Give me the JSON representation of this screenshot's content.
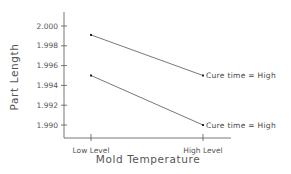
{
  "chart_data": {
    "type": "line",
    "title": "",
    "xlabel": "Mold Temperature",
    "ylabel": "Part Length",
    "categories": [
      "Low Level",
      "High Level"
    ],
    "ylim": [
      1.9885,
      2.0015
    ],
    "yticks": [
      "2.000",
      "1.998",
      "1.996",
      "1.994",
      "1.992",
      "1.990"
    ],
    "ytick_values": [
      2.0,
      1.998,
      1.996,
      1.994,
      1.992,
      1.99
    ],
    "grid": false,
    "legend": "inline labels at line ends",
    "series": [
      {
        "name": "Cure time = High",
        "values": [
          1.9991,
          1.995
        ]
      },
      {
        "name": "Cure time = High",
        "values": [
          1.995,
          1.99
        ]
      }
    ]
  },
  "colors": {
    "axis": "#555555",
    "line": "#555555",
    "text": "#555555"
  }
}
